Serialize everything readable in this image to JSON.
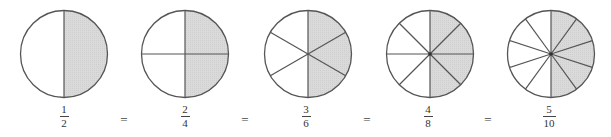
{
  "colors": {
    "shade": "#d6d6d6",
    "stroke": "#555555",
    "background": "#ffffff"
  },
  "fractions": [
    {
      "numerator": "1",
      "denominator": "2",
      "parts": 2,
      "shaded": 1
    },
    {
      "numerator": "2",
      "denominator": "4",
      "parts": 4,
      "shaded": 2
    },
    {
      "numerator": "3",
      "denominator": "6",
      "parts": 6,
      "shaded": 3
    },
    {
      "numerator": "4",
      "denominator": "8",
      "parts": 8,
      "shaded": 4
    },
    {
      "numerator": "5",
      "denominator": "10",
      "parts": 10,
      "shaded": 5
    }
  ],
  "equals_symbol": "="
}
